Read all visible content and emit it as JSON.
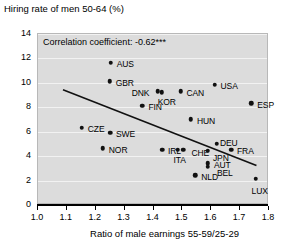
{
  "chart_data": {
    "type": "scatter",
    "title": "Hiring rate of men 50-64 (%)",
    "ylabel": "Hiring rate of men 50-64 (%)",
    "xlabel": "Ratio of male earnings 55-59/25-29",
    "annotation": "Correlation coefficient: -0.62***",
    "xlim": [
      1.0,
      1.8
    ],
    "ylim": [
      0,
      14
    ],
    "xticks": [
      "1.0",
      "1.1",
      "1.2",
      "1.3",
      "1.4",
      "1.5",
      "1.6",
      "1.7",
      "1.8"
    ],
    "xtick_values": [
      1.0,
      1.1,
      1.2,
      1.3,
      1.4,
      1.5,
      1.6,
      1.7,
      1.8
    ],
    "yticks": [
      "0",
      "2",
      "4",
      "6",
      "8",
      "10",
      "12",
      "14"
    ],
    "ytick_values": [
      0,
      2,
      4,
      6,
      8,
      10,
      12,
      14
    ],
    "grid": true,
    "legend": "none",
    "trendline": {
      "x1": 1.09,
      "y1": 9.35,
      "x2": 1.76,
      "y2": 3.15
    },
    "points": [
      {
        "label": "AUS",
        "x": 1.255,
        "y": 11.55,
        "label_dx": 6,
        "label_dy": -3.5
      },
      {
        "label": "GBR",
        "x": 1.252,
        "y": 10.05,
        "label_dx": 6,
        "label_dy": -3.5
      },
      {
        "label": "DNK",
        "x": 1.418,
        "y": 9.25,
        "label_dx": -26,
        "label_dy": -3.5
      },
      {
        "label": "KOR",
        "x": 1.432,
        "y": 9.15,
        "label_dx": -4,
        "label_dy": 4.5
      },
      {
        "label": "CAN",
        "x": 1.497,
        "y": 9.25,
        "label_dx": 6,
        "label_dy": -3.5
      },
      {
        "label": "USA",
        "x": 1.615,
        "y": 9.75,
        "label_dx": 6,
        "label_dy": -3.5
      },
      {
        "label": "FIN",
        "x": 1.365,
        "y": 8.05,
        "label_dx": 6,
        "label_dy": -3.5
      },
      {
        "label": "ESP",
        "x": 1.742,
        "y": 8.25,
        "label_dx": 6,
        "label_dy": -3.5
      },
      {
        "label": "HUN",
        "x": 1.533,
        "y": 6.95,
        "label_dx": 6,
        "label_dy": -3.5
      },
      {
        "label": "CZE",
        "x": 1.155,
        "y": 6.25,
        "label_dx": 6,
        "label_dy": -3.5
      },
      {
        "label": "SWE",
        "x": 1.253,
        "y": 5.85,
        "label_dx": 6,
        "label_dy": -3.5
      },
      {
        "label": "DEU",
        "x": 1.623,
        "y": 4.95,
        "label_dx": 3,
        "label_dy": -5.5
      },
      {
        "label": "NOR",
        "x": 1.228,
        "y": 4.55,
        "label_dx": 6,
        "label_dy": -3.5
      },
      {
        "label": "IRL",
        "x": 1.433,
        "y": 4.45,
        "label_dx": 6,
        "label_dy": -3.5
      },
      {
        "label": "ITA",
        "x": 1.487,
        "y": 4.45,
        "label_dx": -4,
        "label_dy": 5
      },
      {
        "label": "CHE",
        "x": 1.507,
        "y": 4.45,
        "label_dx": 8,
        "label_dy": -2
      },
      {
        "label": "JPN",
        "x": 1.592,
        "y": 4.35,
        "label_dx": 5,
        "label_dy": 2
      },
      {
        "label": "FRA",
        "x": 1.672,
        "y": 4.45,
        "label_dx": 6,
        "label_dy": -3.5
      },
      {
        "label": "AUT",
        "x": 1.592,
        "y": 3.35,
        "label_dx": 6,
        "label_dy": -3.5
      },
      {
        "label": "BEL",
        "x": 1.592,
        "y": 3.05,
        "label_dx": 9,
        "label_dy": 1
      },
      {
        "label": "NLD",
        "x": 1.548,
        "y": 2.35,
        "label_dx": 6,
        "label_dy": -3.5
      },
      {
        "label": "LUX",
        "x": 1.757,
        "y": 2.05,
        "label_dx": -4,
        "label_dy": 7
      }
    ]
  }
}
